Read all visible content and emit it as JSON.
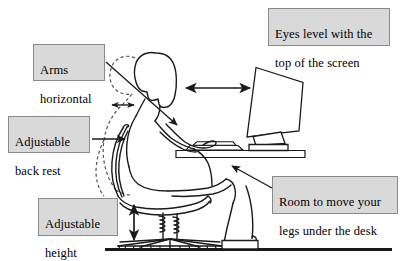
{
  "diagram": {
    "background_color": "#ffffff",
    "ink_color": "#1a1a1a",
    "callout_fill": "#d9d9d9",
    "callout_border": "#8a8a8a",
    "floor_label": "floor line"
  },
  "callouts": {
    "arms_horizontal": {
      "line1": "Arms",
      "line2": "horizontal"
    },
    "adjustable_back_rest": {
      "line1": "Adjustable",
      "line2": "back rest"
    },
    "adjustable_height": {
      "line1": "Adjustable",
      "line2": "height"
    },
    "eyes_level": {
      "line1": "Eyes level with the",
      "line2": "top of the screen"
    },
    "room_to_move": {
      "line1": "Room to move your",
      "line2": "legs under the desk"
    }
  },
  "scene_parts": {
    "person": "seated person in profile",
    "slouched_posture": "dashed outline of poor slouched posture",
    "chair": "office chair with backrest, seat, gas lift cylinder and five star caster base",
    "desk": "desk top with keyboard",
    "monitor": "tilted CRT monitor on stand",
    "footrest": "footrest block under feet",
    "floor": "floor ground line"
  },
  "indicators": {
    "eye_to_screen": "horizontal double headed arrow between eyes and screen",
    "chair_height": "vertical double headed arrow at chair cylinder",
    "back_gap": "small horizontal double headed arrow at upper back",
    "arms_pointer": "diagonal arrow pointing to forearm and elbow",
    "back_rest_pointer": "horizontal arrow pointing to chair backrest",
    "legroom_pointer": "diagonal arrow pointing to space under desk"
  }
}
